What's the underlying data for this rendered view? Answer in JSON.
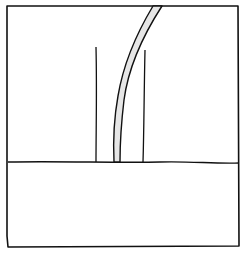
{
  "drawing": {
    "stroke_color": "#111111",
    "background": "#ffffff",
    "band_fill": "#e6e6e6",
    "description": "line sketch"
  }
}
